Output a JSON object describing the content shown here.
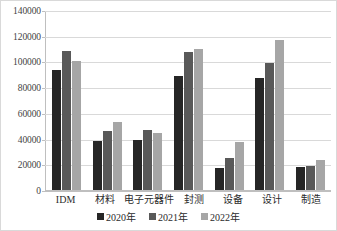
{
  "chart_data": {
    "type": "bar",
    "title": "",
    "subtitle": "",
    "xlabel": "",
    "ylabel": "",
    "categories": [
      "IDM",
      "材料",
      "电子元器件",
      "封测",
      "设备",
      "设计",
      "制造"
    ],
    "series": [
      {
        "name": "2020年",
        "color": "#262626",
        "values": [
          93000,
          38000,
          39000,
          89000,
          17000,
          87000,
          18000
        ]
      },
      {
        "name": "2021年",
        "color": "#595959",
        "values": [
          108000,
          46000,
          47000,
          107000,
          25000,
          99000,
          19000
        ]
      },
      {
        "name": "2022年",
        "color": "#a6a6a6",
        "values": [
          100000,
          53000,
          44000,
          110000,
          37000,
          117000,
          23000
        ]
      }
    ],
    "ylim": [
      0,
      140000
    ],
    "ytick_step": 20000,
    "ytick_labels": [
      "140000",
      "120000",
      "100000",
      "80000",
      "60000",
      "40000",
      "20000",
      "0"
    ],
    "ytick_values": [
      140000,
      120000,
      100000,
      80000,
      60000,
      40000,
      20000,
      0
    ],
    "grid": true,
    "legend_position": "bottom",
    "colors": {
      "gridline": "#d9d9d9",
      "axis": "#bfbfbf",
      "border": "#d9d9d9",
      "text": "#2b2b2b",
      "background": "#ffffff"
    }
  }
}
